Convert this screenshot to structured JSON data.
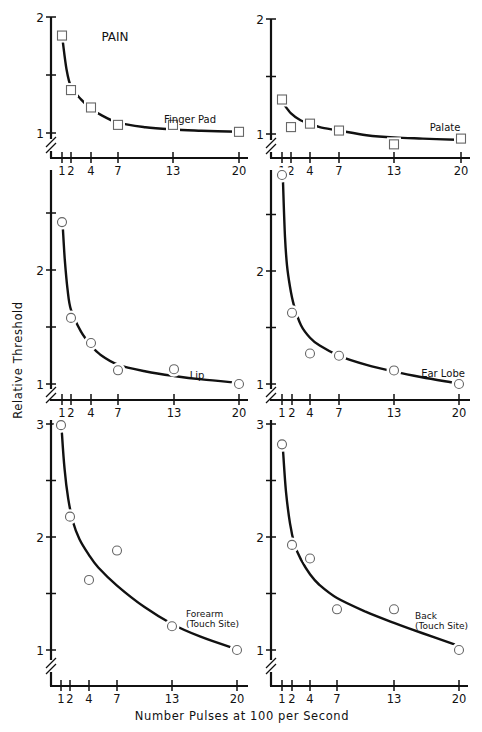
{
  "chart_data": {
    "type": "scatter",
    "title": "PAIN",
    "xlabel": "Number Pulses at 100 per Second",
    "ylabel": "Relative Threshold",
    "x_ticks": [
      1,
      2,
      4,
      7,
      13,
      20
    ],
    "x_tick_labels": [
      "1",
      "2",
      "4",
      "7",
      "13",
      "20"
    ],
    "grid": false,
    "panels": [
      {
        "name": "Finger Pad",
        "label_lines": [
          "Finger Pad"
        ],
        "marker": "square",
        "ylim": [
          0.8,
          2.0
        ],
        "y_ticks": [
          1,
          1.5,
          2
        ],
        "y_tick_labels": [
          "1",
          "",
          "2"
        ],
        "x": [
          1,
          2,
          4,
          7,
          13,
          20
        ],
        "y": [
          1.84,
          1.37,
          1.22,
          1.07,
          1.07,
          1.01
        ],
        "fit": [
          [
            1.1,
            1.78
          ],
          [
            1.5,
            1.55
          ],
          [
            2,
            1.4
          ],
          [
            3,
            1.29
          ],
          [
            4,
            1.21
          ],
          [
            5,
            1.16
          ],
          [
            7,
            1.09
          ],
          [
            10,
            1.05
          ],
          [
            13,
            1.03
          ],
          [
            16,
            1.02
          ],
          [
            20,
            1.01
          ]
        ]
      },
      {
        "name": "Palate",
        "label_lines": [
          "Palate"
        ],
        "marker": "square",
        "ylim": [
          0.8,
          2.0
        ],
        "y_ticks": [
          1,
          1.5,
          2
        ],
        "y_tick_labels": [
          "1",
          "",
          "2"
        ],
        "x": [
          1,
          2,
          4,
          7,
          13,
          20
        ],
        "y": [
          1.3,
          1.06,
          1.09,
          1.03,
          0.91,
          0.96
        ],
        "fit": [
          [
            1.2,
            1.26
          ],
          [
            2,
            1.18
          ],
          [
            3,
            1.12
          ],
          [
            4,
            1.09
          ],
          [
            5,
            1.06
          ],
          [
            7,
            1.03
          ],
          [
            10,
            0.99
          ],
          [
            13,
            0.97
          ],
          [
            16,
            0.96
          ],
          [
            19.5,
            0.95
          ]
        ]
      },
      {
        "name": "Lip",
        "label_lines": [
          "Lip"
        ],
        "marker": "circle",
        "ylim": [
          0.9,
          2.8
        ],
        "y_ticks": [
          1,
          1.5,
          2,
          2.5
        ],
        "y_tick_labels": [
          "1",
          "",
          "2",
          ""
        ],
        "x": [
          1,
          2,
          4,
          7,
          13,
          20
        ],
        "y": [
          2.42,
          1.58,
          1.36,
          1.12,
          1.13,
          1.0
        ],
        "fit": [
          [
            1.1,
            2.36
          ],
          [
            1.3,
            2.1
          ],
          [
            1.6,
            1.84
          ],
          [
            2,
            1.65
          ],
          [
            3,
            1.46
          ],
          [
            4,
            1.34
          ],
          [
            5,
            1.26
          ],
          [
            7,
            1.17
          ],
          [
            10,
            1.11
          ],
          [
            13,
            1.07
          ],
          [
            16,
            1.04
          ],
          [
            20,
            1.01
          ]
        ]
      },
      {
        "name": "Ear Lobe",
        "label_lines": [
          "Ear Lobe"
        ],
        "marker": "circle",
        "ylim": [
          0.9,
          2.8
        ],
        "y_ticks": [
          1,
          1.5,
          2,
          2.5
        ],
        "y_tick_labels": [
          "1",
          "",
          "2",
          ""
        ],
        "x": [
          1,
          2,
          4,
          7,
          13,
          20
        ],
        "y": [
          2.85,
          1.63,
          1.27,
          1.25,
          1.12,
          1.0
        ],
        "fit": [
          [
            1.1,
            2.79
          ],
          [
            1.3,
            2.3
          ],
          [
            1.5,
            2.05
          ],
          [
            1.8,
            1.86
          ],
          [
            2.2,
            1.7
          ],
          [
            3,
            1.52
          ],
          [
            4,
            1.41
          ],
          [
            5,
            1.34
          ],
          [
            7,
            1.25
          ],
          [
            10,
            1.17
          ],
          [
            13,
            1.11
          ],
          [
            16,
            1.06
          ],
          [
            19.5,
            1.01
          ]
        ]
      },
      {
        "name": "Forearm (Touch Site)",
        "label_lines": [
          "Forearm",
          "(Touch Site)"
        ],
        "marker": "circle",
        "ylim": [
          0.7,
          3.0
        ],
        "y_ticks": [
          1,
          1.5,
          2,
          2.5,
          3
        ],
        "y_tick_labels": [
          "1",
          "",
          "2",
          "",
          "3"
        ],
        "x": [
          1,
          2,
          4,
          7,
          13,
          20
        ],
        "y": [
          2.99,
          2.18,
          1.62,
          1.88,
          1.21,
          1.0
        ],
        "fit": [
          [
            1.1,
            2.92
          ],
          [
            1.4,
            2.6
          ],
          [
            1.8,
            2.34
          ],
          [
            2.3,
            2.14
          ],
          [
            3,
            1.98
          ],
          [
            4,
            1.84
          ],
          [
            5,
            1.73
          ],
          [
            7,
            1.57
          ],
          [
            10,
            1.38
          ],
          [
            13,
            1.23
          ],
          [
            16,
            1.12
          ],
          [
            19.5,
            1.02
          ]
        ]
      },
      {
        "name": "Back (Touch Site)",
        "label_lines": [
          "Back",
          "(Touch Site)"
        ],
        "marker": "circle",
        "ylim": [
          0.7,
          3.0
        ],
        "y_ticks": [
          1,
          1.5,
          2,
          2.5,
          3
        ],
        "y_tick_labels": [
          "1",
          "",
          "2",
          "",
          "3"
        ],
        "x": [
          1,
          2,
          4,
          7,
          13,
          20
        ],
        "y": [
          2.82,
          1.93,
          1.81,
          1.36,
          1.36,
          1.0
        ],
        "fit": [
          [
            1.1,
            2.77
          ],
          [
            1.4,
            2.4
          ],
          [
            1.8,
            2.12
          ],
          [
            2.3,
            1.93
          ],
          [
            3,
            1.8
          ],
          [
            4,
            1.67
          ],
          [
            5,
            1.58
          ],
          [
            7,
            1.46
          ],
          [
            10,
            1.34
          ],
          [
            13,
            1.24
          ],
          [
            16,
            1.15
          ],
          [
            19.5,
            1.05
          ]
        ]
      }
    ]
  }
}
